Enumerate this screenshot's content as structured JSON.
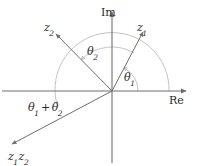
{
  "figure": {
    "width": 197,
    "height": 166,
    "background": "#ffffff",
    "line_color": "#7a7a7a",
    "arc_color": "#b0b0b0",
    "text_color": "#2b2b2b"
  },
  "axes": {
    "imaginary": {
      "label": "Im",
      "x": 101,
      "y": 7
    },
    "real": {
      "label": "Re",
      "x": 169,
      "y": 95
    },
    "origin": {
      "x": 112,
      "y": 91
    }
  },
  "vectors": [
    {
      "name": "z1",
      "label_main": "z",
      "label_sub": "1",
      "label_x": 137,
      "label_y": 22,
      "tip_x": 142,
      "tip_y": 33
    },
    {
      "name": "z2",
      "label_main": "z",
      "label_sub": "2",
      "label_x": 44,
      "label_y": 22,
      "tip_x": 57,
      "tip_y": 35
    },
    {
      "name": "z1z2",
      "label_main": "z",
      "label_sub": "1",
      "label_main2": "z",
      "label_sub2": "2",
      "label_x": 8,
      "label_y": 151,
      "tip_x": 13,
      "tip_y": 145
    }
  ],
  "angles": [
    {
      "name": "theta1",
      "symbol": "θ",
      "subscript": "1",
      "x": 124,
      "y": 72,
      "arc_radius": 26
    },
    {
      "name": "theta2",
      "symbol": "θ",
      "subscript": "2",
      "x": 87,
      "y": 46,
      "arc_radius": 44
    },
    {
      "name": "theta1-plus-theta2",
      "symbol": "θ",
      "subscript": "1",
      "operator": "+",
      "symbol2": "θ",
      "subscript2": "2",
      "x": 28,
      "y": 102,
      "arc_radius": 57
    }
  ]
}
